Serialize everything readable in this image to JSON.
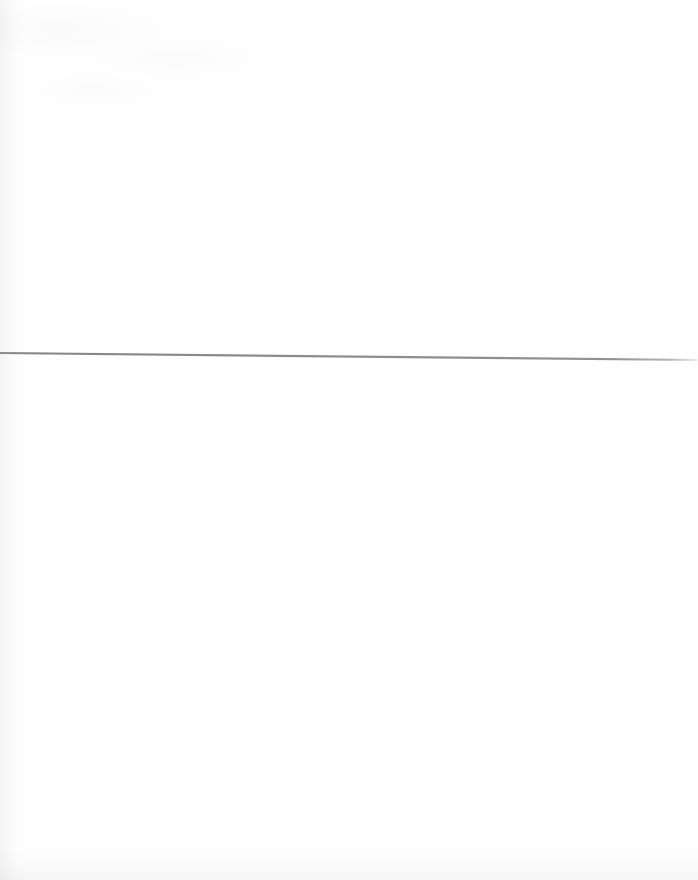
{
  "document": {
    "kind": "scanned-page",
    "page_label": "",
    "visible_text": "",
    "description": "Blank scanned page bearing a single thin horizontal rule"
  },
  "canvas": {
    "width": 698,
    "height": 880,
    "background_color": "#ffffff",
    "paper_color": "#fefefe"
  },
  "horizontal_rule": {
    "name": "horizontal-rule",
    "color": "#8a8a8a",
    "color_light_end": "#b9b9b9",
    "thickness": 2.2,
    "x_start": 0,
    "y_start": 353,
    "x_end": 697,
    "y_end": 360,
    "taper_start_x": 660
  },
  "artifacts": {
    "left_edge_shadow": "#969696",
    "bottom_edge_shadow": "#969696",
    "top_ghost_texture": "#969696"
  }
}
